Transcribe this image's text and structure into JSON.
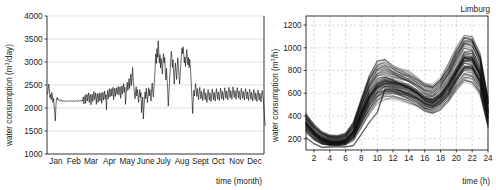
{
  "figure": {
    "background": "#ffffff",
    "line_color": "#0a0a0a",
    "grid_color": "#d2d2d2",
    "grid_dash_color": "#bdbdc6"
  },
  "chart_data": [
    {
      "id": "annual-daily-consumption",
      "type": "line",
      "title": "",
      "xlabel": "time (month)",
      "ylabel": "water consumption (m³/day)",
      "ylabel_main": "water consumption (m",
      "ylabel_sup": "3",
      "ylabel_tail": "/day)",
      "xlim": [
        0,
        365
      ],
      "ylim": [
        1000,
        4000
      ],
      "grid": true,
      "grid_style": "solid",
      "legend": "none",
      "ytick_labels": [
        "1000",
        "1500",
        "2000",
        "2500",
        "3000",
        "3500",
        "4000"
      ],
      "ytick_values": [
        1000,
        1500,
        2000,
        2500,
        3000,
        3500,
        4000
      ],
      "categories": [
        "Jan",
        "Feb",
        "Mar",
        "Apr",
        "May",
        "June",
        "July",
        "Aug",
        "Sept",
        "Oct",
        "Nov",
        "Dec"
      ],
      "xtick_values": [
        15,
        45,
        74,
        105,
        135,
        166,
        196,
        227,
        258,
        288,
        319,
        349
      ],
      "series": [
        {
          "name": "daily water consumption",
          "x_start": 1,
          "x_step": 1,
          "values": [
            2300,
            2420,
            2520,
            2400,
            2230,
            2290,
            2180,
            2340,
            2260,
            2120,
            2210,
            2050,
            1900,
            1720,
            2050,
            2190,
            2230,
            2180,
            2200,
            2170,
            2150,
            2160,
            2180,
            2150,
            2160,
            2140,
            2150,
            2160,
            2140,
            2155,
            2150,
            2145,
            2160,
            2150,
            2140,
            2150,
            2160,
            2145,
            2150,
            2155,
            2160,
            2140,
            2150,
            2145,
            2160,
            2150,
            2140,
            2155,
            2150,
            2160,
            2140,
            2150,
            2170,
            2160,
            2150,
            2165,
            2150,
            2145,
            2175,
            2160,
            2240,
            2090,
            2170,
            2280,
            2100,
            2230,
            2300,
            2150,
            2260,
            2330,
            2120,
            2250,
            2300,
            2070,
            2210,
            2300,
            2140,
            2280,
            2360,
            2180,
            2240,
            2330,
            2080,
            2230,
            2310,
            2120,
            2270,
            2330,
            2150,
            2260,
            2330,
            2100,
            2250,
            2340,
            2170,
            2280,
            2370,
            2190,
            2290,
            1960,
            2230,
            2380,
            2200,
            2310,
            2420,
            2240,
            2330,
            2420,
            2260,
            2360,
            2450,
            2180,
            2320,
            2430,
            2250,
            2350,
            2440,
            2300,
            2390,
            2470,
            2280,
            2380,
            2460,
            2210,
            2350,
            2480,
            2300,
            2420,
            2530,
            2340,
            2450,
            2080,
            2290,
            2430,
            2560,
            2380,
            2500,
            2640,
            2420,
            2580,
            2740,
            2490,
            2660,
            2880,
            2600,
            2470,
            2350,
            2200,
            2330,
            2460,
            2260,
            2400,
            2290,
            2120,
            2270,
            2400,
            2230,
            2340,
            1900,
            2080,
            2240,
            1760,
            2000,
            2190,
            2350,
            2200,
            2430,
            2290,
            2120,
            2300,
            2440,
            2260,
            2400,
            2300,
            2150,
            2420,
            2540,
            2330,
            2240,
            2470,
            2660,
            2900,
            3180,
            2970,
            3290,
            3100,
            3460,
            3230,
            2980,
            3160,
            2870,
            3080,
            2920,
            2740,
            2990,
            3180,
            2980,
            3100,
            2780,
            2610,
            2860,
            2620,
            2390,
            2040,
            2300,
            2550,
            2780,
            3010,
            3230,
            3120,
            2880,
            3050,
            2760,
            2520,
            2770,
            2980,
            2800,
            2620,
            2880,
            3090,
            2900,
            2700,
            2520,
            2730,
            2950,
            3120,
            3300,
            3180,
            3330,
            3160,
            2980,
            3110,
            2900,
            3060,
            3270,
            3120,
            2940,
            3100,
            2880,
            3060,
            2920,
            2700,
            2430,
            2180,
            1880,
            2150,
            2380,
            2260,
            2420,
            2530,
            2380,
            2250,
            2420,
            2300,
            2180,
            2340,
            2450,
            2320,
            2200,
            2360,
            2280,
            2160,
            2310,
            2420,
            2300,
            2180,
            2330,
            2240,
            2120,
            2280,
            2400,
            2290,
            2170,
            2330,
            2250,
            2140,
            2300,
            2410,
            2300,
            2180,
            2340,
            2260,
            2150,
            2310,
            2420,
            2310,
            2190,
            2350,
            2270,
            2160,
            2320,
            2430,
            2320,
            2200,
            2360,
            2280,
            2170,
            2330,
            2440,
            2330,
            2210,
            2370,
            2290,
            2180,
            2340,
            2450,
            2340,
            2220,
            2380,
            2300,
            2190,
            2350,
            2460,
            2340,
            2230,
            2380,
            2300,
            2190,
            2350,
            2440,
            2330,
            2220,
            2370,
            2290,
            2180,
            2340,
            2430,
            2320,
            2210,
            2360,
            2280,
            2170,
            2330,
            2420,
            2310,
            2200,
            2350,
            2270,
            2160,
            2320,
            2410,
            2300,
            2190,
            2340,
            2260,
            2150,
            2310,
            2400,
            2290,
            2180,
            2330,
            2250,
            2140,
            2300,
            2390,
            2280,
            2170,
            2320,
            2240,
            2130,
            2290,
            2380,
            2270,
            2160,
            1980,
            1800,
            1620
          ]
        }
      ]
    },
    {
      "id": "limburg-daily-profiles",
      "type": "line",
      "title": "Limburg",
      "xlabel": "time (h)",
      "ylabel": "water consumption (m³/h)",
      "ylabel_main": "water consumption (m",
      "ylabel_sup": "3",
      "ylabel_tail": "/h)",
      "xlim": [
        1,
        24
      ],
      "ylim": [
        100,
        1280
      ],
      "grid": true,
      "grid_style": "dashed",
      "legend": "none",
      "ytick_labels": [
        "200",
        "400",
        "600",
        "800",
        "1000",
        "1200"
      ],
      "ytick_values": [
        200,
        400,
        600,
        800,
        1000,
        1200
      ],
      "xtick_labels": [
        "2",
        "4",
        "6",
        "8",
        "10",
        "12",
        "14",
        "16",
        "18",
        "20",
        "22",
        "24"
      ],
      "xtick_values": [
        2,
        4,
        6,
        8,
        10,
        12,
        14,
        16,
        18,
        20,
        22,
        24
      ],
      "x": [
        1,
        2,
        3,
        4,
        5,
        6,
        7,
        8,
        9,
        10,
        11,
        12,
        13,
        14,
        15,
        16,
        17,
        18,
        19,
        20,
        21,
        22,
        23,
        24
      ],
      "profile_count": 120,
      "median_profile": [
        330,
        250,
        195,
        170,
        168,
        180,
        255,
        420,
        570,
        665,
        700,
        690,
        665,
        640,
        600,
        545,
        530,
        575,
        665,
        790,
        905,
        900,
        760,
        430
      ],
      "upper_envelope": [
        430,
        330,
        265,
        235,
        230,
        250,
        350,
        560,
        760,
        880,
        900,
        845,
        810,
        790,
        745,
        690,
        680,
        740,
        860,
        1010,
        1120,
        1110,
        960,
        560
      ],
      "lower_envelope": [
        250,
        190,
        150,
        140,
        138,
        145,
        185,
        300,
        420,
        520,
        560,
        560,
        540,
        515,
        480,
        430,
        420,
        455,
        520,
        620,
        700,
        690,
        590,
        300
      ],
      "note": "overlaid diurnal water demand profiles, one line per day"
    }
  ]
}
